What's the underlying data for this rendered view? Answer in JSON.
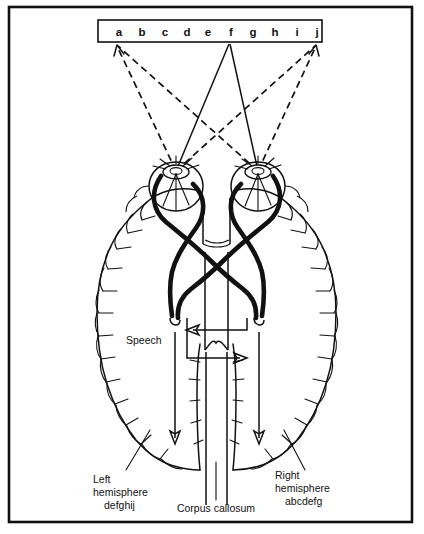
{
  "figure": {
    "frame": {
      "stroke": "#111111"
    }
  },
  "letter_strip": {
    "name": "stimulus-letter-strip",
    "letters": [
      "a",
      "b",
      "c",
      "d",
      "e",
      "f",
      "g",
      "h",
      "i",
      "j"
    ],
    "fixation_letter": "f",
    "left_end_letter": "a",
    "right_end_letter": "j"
  },
  "sight_lines": {
    "solid_target": "f",
    "dashed_targets": [
      "a",
      "j"
    ],
    "description": "solid lines converge on fixation point f; dashed lines run to the field edges a and j"
  },
  "eyes": {
    "left": {
      "name": "left-eye"
    },
    "right": {
      "name": "right-eye"
    }
  },
  "pathways": {
    "optic_chiasm": {
      "name": "optic-chiasm"
    }
  },
  "labels": {
    "speech": "Speech",
    "left_hemisphere": {
      "line1": "Left",
      "line2": "hemisphere",
      "line3": "defghij"
    },
    "right_hemisphere": {
      "line1": "Right",
      "line2": "hemisphere",
      "line3": "abcdefg"
    },
    "corpus_callosum": "Corpus callosum"
  },
  "colors": {
    "ink": "#111111",
    "background": "#ffffff"
  }
}
